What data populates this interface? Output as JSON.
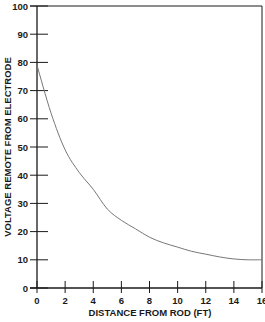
{
  "chart_data": {
    "type": "line",
    "title": "",
    "xlabel": "DISTANCE FROM ROD (FT)",
    "ylabel": "VOLTAGE REMOTE FROM ELECTRODE",
    "xlim": [
      0,
      16
    ],
    "ylim": [
      0,
      100
    ],
    "x_ticks": [
      0,
      2,
      4,
      6,
      8,
      10,
      12,
      14,
      16
    ],
    "y_ticks": [
      0,
      10,
      20,
      30,
      40,
      50,
      60,
      70,
      80,
      90,
      100
    ],
    "grid": false,
    "legend": null,
    "series": [
      {
        "name": "Voltage",
        "x": [
          0,
          1,
          2,
          3,
          4,
          5,
          6,
          7,
          8,
          9,
          10,
          11,
          12,
          13,
          14,
          15,
          16
        ],
        "values": [
          79,
          62,
          49,
          41,
          35,
          28,
          24,
          21,
          18,
          16,
          14.5,
          13,
          12,
          11,
          10.3,
          10,
          10
        ]
      }
    ],
    "colors": {
      "axis": "#1a1a1a",
      "line": "#777777"
    }
  }
}
